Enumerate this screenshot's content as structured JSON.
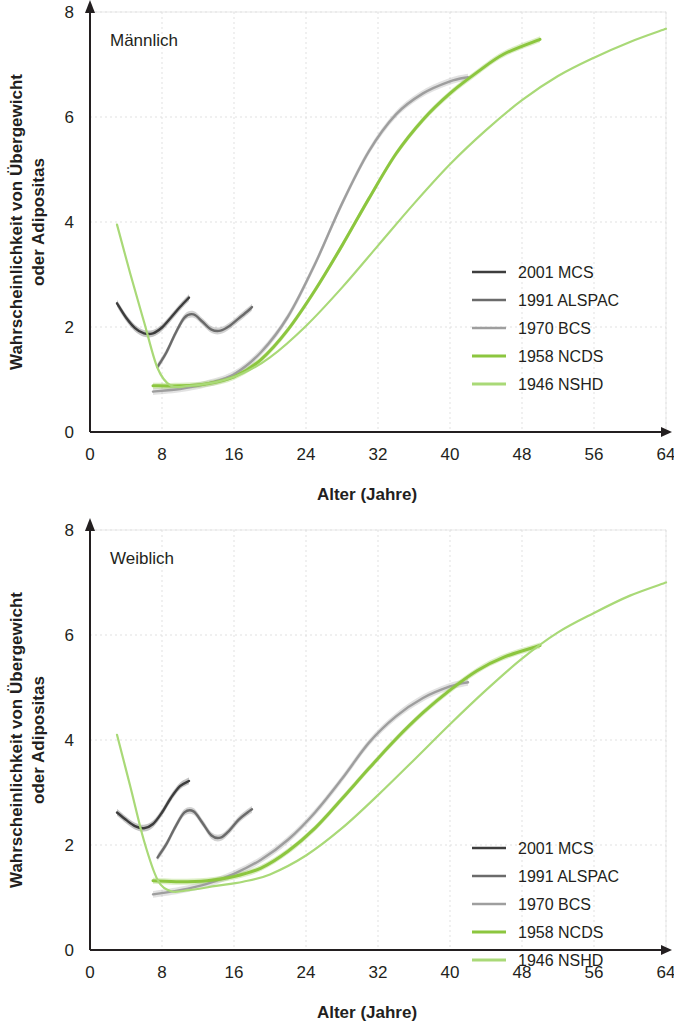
{
  "figure": {
    "panels": [
      {
        "id": "male",
        "title": "Männlich",
        "xlabel": "Alter (Jahre)",
        "ylabel_line1": "Wahrscheinlichkeit von Übergewicht",
        "ylabel_line2": "oder Adipositas"
      },
      {
        "id": "female",
        "title": "Weiblich",
        "xlabel": "Alter (Jahre)",
        "ylabel_line1": "Wahrscheinlichkeit von Übergewicht",
        "ylabel_line2": "oder Adipositas"
      }
    ],
    "xticks": [
      "0",
      "8",
      "16",
      "24",
      "32",
      "40",
      "48",
      "56",
      "64"
    ],
    "yticks": [
      "0",
      "2",
      "4",
      "6",
      "8"
    ],
    "legend": [
      {
        "label": "2001 MCS",
        "color": "#3d3d3d"
      },
      {
        "label": "1991 ALSPAC",
        "color": "#6b6b6b"
      },
      {
        "label": "1970 BCS",
        "color": "#9e9e9e"
      },
      {
        "label": "1958 NCDS",
        "color": "#8cc63f"
      },
      {
        "label": "1946 NSHD",
        "color": "#a9d977"
      }
    ]
  },
  "chart_data": [
    {
      "type": "line",
      "title": "Männlich",
      "xlabel": "Alter (Jahre)",
      "ylabel": "Wahrscheinlichkeit von Übergewicht oder Adipositas",
      "xlim": [
        0,
        64
      ],
      "ylim": [
        0,
        8
      ],
      "xticks": [
        0,
        8,
        16,
        24,
        32,
        40,
        48,
        56,
        64
      ],
      "yticks": [
        0,
        2,
        4,
        6,
        8
      ],
      "grid": true,
      "legend_position": "right-middle",
      "series": [
        {
          "name": "2001 MCS",
          "color": "#3d3d3d",
          "band": true,
          "x": [
            3.0,
            4.0,
            5.0,
            6.0,
            7.0,
            8.0,
            9.0,
            10.0,
            11.0
          ],
          "y": [
            2.45,
            2.18,
            1.98,
            1.88,
            1.88,
            1.99,
            2.18,
            2.38,
            2.56
          ]
        },
        {
          "name": "1991 ALSPAC",
          "color": "#6b6b6b",
          "band": true,
          "x": [
            7.5,
            8.5,
            9.5,
            10.5,
            11.5,
            12.5,
            13.5,
            14.5,
            15.5,
            16.5,
            17.5,
            18.0
          ],
          "y": [
            1.24,
            1.52,
            1.88,
            2.18,
            2.24,
            2.1,
            1.95,
            1.93,
            2.02,
            2.16,
            2.3,
            2.38
          ]
        },
        {
          "name": "1970 BCS",
          "color": "#9e9e9e",
          "band": true,
          "x": [
            7.0,
            10.0,
            13.0,
            16.0,
            19.0,
            22.0,
            25.0,
            28.0,
            31.0,
            34.0,
            37.0,
            40.0,
            42.0
          ],
          "y": [
            0.77,
            0.82,
            0.92,
            1.1,
            1.52,
            2.2,
            3.2,
            4.35,
            5.35,
            6.05,
            6.45,
            6.68,
            6.76
          ]
        },
        {
          "name": "1958 NCDS",
          "color": "#8cc63f",
          "band": true,
          "x": [
            7.0,
            10.0,
            13.0,
            16.0,
            19.0,
            22.0,
            25.0,
            28.0,
            31.0,
            34.0,
            37.0,
            40.0,
            43.0,
            46.0,
            50.0
          ],
          "y": [
            0.88,
            0.88,
            0.92,
            1.05,
            1.38,
            1.95,
            2.7,
            3.55,
            4.45,
            5.3,
            5.95,
            6.45,
            6.85,
            7.2,
            7.48
          ]
        },
        {
          "name": "1946 NSHD",
          "color": "#a9d977",
          "band": false,
          "x": [
            3.0,
            4.5,
            6.0,
            7.5,
            9.0,
            11.0,
            14.0,
            17.0,
            20.0,
            24.0,
            28.0,
            32.0,
            36.0,
            40.0,
            44.0,
            48.0,
            52.0,
            56.0,
            60.0,
            64.0
          ],
          "y": [
            3.95,
            3.0,
            2.1,
            1.22,
            0.88,
            0.88,
            0.95,
            1.12,
            1.42,
            2.02,
            2.75,
            3.55,
            4.35,
            5.1,
            5.75,
            6.32,
            6.78,
            7.13,
            7.43,
            7.68
          ]
        }
      ]
    },
    {
      "type": "line",
      "title": "Weiblich",
      "xlabel": "Alter (Jahre)",
      "ylabel": "Wahrscheinlichkeit von Übergewicht oder Adipositas",
      "xlim": [
        0,
        64
      ],
      "ylim": [
        0,
        8
      ],
      "xticks": [
        0,
        8,
        16,
        24,
        32,
        40,
        48,
        56,
        64
      ],
      "yticks": [
        0,
        2,
        4,
        6,
        8
      ],
      "grid": true,
      "legend_position": "right-middle",
      "series": [
        {
          "name": "2001 MCS",
          "color": "#3d3d3d",
          "band": true,
          "x": [
            3.0,
            4.0,
            5.0,
            6.0,
            7.0,
            8.0,
            9.0,
            10.0,
            11.0
          ],
          "y": [
            2.62,
            2.48,
            2.36,
            2.32,
            2.4,
            2.62,
            2.9,
            3.12,
            3.22
          ]
        },
        {
          "name": "1991 ALSPAC",
          "color": "#6b6b6b",
          "band": true,
          "x": [
            7.5,
            8.5,
            9.5,
            10.5,
            11.5,
            12.5,
            13.5,
            14.5,
            15.5,
            16.5,
            17.5,
            18.0
          ],
          "y": [
            1.76,
            2.02,
            2.35,
            2.62,
            2.64,
            2.42,
            2.18,
            2.14,
            2.28,
            2.48,
            2.62,
            2.68
          ]
        },
        {
          "name": "1970 BCS",
          "color": "#9e9e9e",
          "band": true,
          "x": [
            7.0,
            10.0,
            13.0,
            16.0,
            19.0,
            22.0,
            25.0,
            28.0,
            31.0,
            34.0,
            37.0,
            40.0,
            42.0
          ],
          "y": [
            1.06,
            1.14,
            1.26,
            1.45,
            1.72,
            2.1,
            2.62,
            3.26,
            3.95,
            4.45,
            4.8,
            5.02,
            5.1
          ]
        },
        {
          "name": "1958 NCDS",
          "color": "#8cc63f",
          "band": true,
          "x": [
            7.0,
            10.0,
            13.0,
            16.0,
            19.0,
            22.0,
            25.0,
            28.0,
            31.0,
            34.0,
            37.0,
            40.0,
            43.0,
            46.0,
            50.0
          ],
          "y": [
            1.32,
            1.3,
            1.32,
            1.4,
            1.56,
            1.88,
            2.32,
            2.88,
            3.46,
            4.02,
            4.52,
            4.95,
            5.32,
            5.58,
            5.8
          ]
        },
        {
          "name": "1946 NSHD",
          "color": "#a9d977",
          "band": false,
          "x": [
            3.0,
            4.5,
            6.0,
            7.5,
            9.0,
            11.0,
            14.0,
            17.0,
            20.0,
            24.0,
            28.0,
            32.0,
            36.0,
            40.0,
            44.0,
            48.0,
            52.0,
            56.0,
            60.0,
            64.0
          ],
          "y": [
            4.1,
            3.1,
            2.08,
            1.34,
            1.12,
            1.14,
            1.22,
            1.3,
            1.44,
            1.8,
            2.32,
            2.95,
            3.62,
            4.3,
            4.95,
            5.55,
            6.05,
            6.42,
            6.75,
            7.0
          ]
        }
      ]
    }
  ]
}
